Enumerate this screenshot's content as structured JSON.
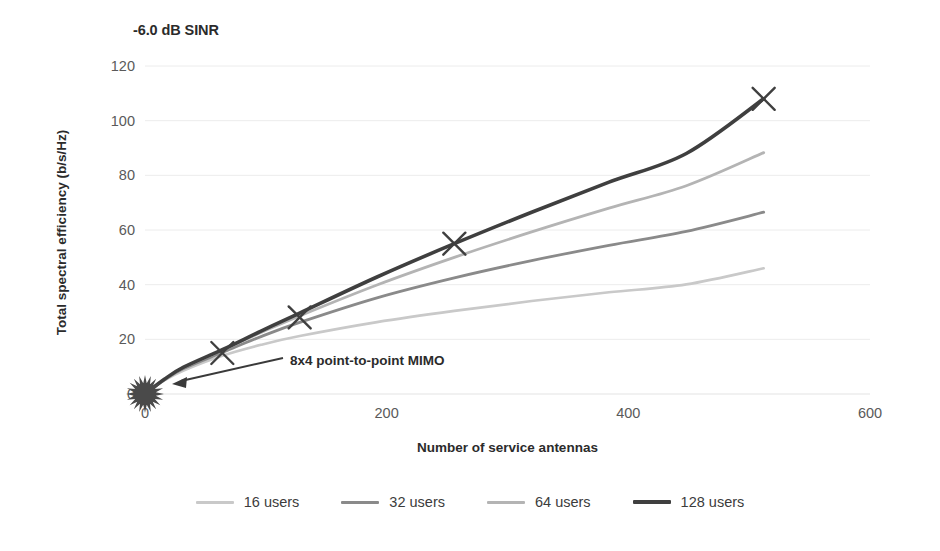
{
  "chart_data": {
    "type": "line",
    "title": "-6.0 dB SINR",
    "xlabel": "Number of service antennas",
    "ylabel": "Total spectral efficiency (b/s/Hz)",
    "xlim": [
      0,
      600
    ],
    "ylim": [
      0,
      120
    ],
    "xticks": [
      "0",
      "200",
      "400",
      "600"
    ],
    "xtick_values": [
      0,
      200,
      400,
      600
    ],
    "yticks": [
      "0",
      "20",
      "40",
      "60",
      "80",
      "100",
      "120"
    ],
    "ytick_values": [
      0,
      20,
      40,
      60,
      80,
      100,
      120
    ],
    "grid": "horizontal",
    "legend_position": "bottom",
    "series": [
      {
        "name": "16 users",
        "color": "#c9c9c9",
        "width": 2.6,
        "x": [
          0,
          16,
          32,
          64,
          96,
          128,
          192,
          256,
          320,
          384,
          448,
          512
        ],
        "values": [
          0,
          5.0,
          8.6,
          14.0,
          18.0,
          21.2,
          26.3,
          30.4,
          34.0,
          37.2,
          40.1,
          46.0
        ]
      },
      {
        "name": "32 users",
        "color": "#8a8a8a",
        "width": 2.8,
        "x": [
          0,
          16,
          32,
          64,
          96,
          128,
          192,
          256,
          320,
          384,
          448,
          512
        ],
        "values": [
          0,
          5.2,
          9.3,
          15.2,
          21.0,
          26.2,
          35.2,
          42.5,
          48.8,
          54.4,
          59.5,
          66.5
        ]
      },
      {
        "name": "64 users",
        "color": "#b4b4b4",
        "width": 2.8,
        "x": [
          0,
          16,
          32,
          64,
          96,
          128,
          192,
          256,
          320,
          384,
          448,
          512
        ],
        "values": [
          0,
          5.3,
          9.6,
          16.0,
          22.5,
          28.6,
          39.9,
          50.0,
          59.3,
          68.0,
          76.2,
          88.3
        ]
      },
      {
        "name": "128 users",
        "color": "#3f3f3f",
        "width": 3.6,
        "x": [
          0,
          16,
          32,
          64,
          96,
          128,
          192,
          256,
          320,
          384,
          448,
          512
        ],
        "values": [
          0,
          5.4,
          9.8,
          16.2,
          23.0,
          29.6,
          42.8,
          55.0,
          66.5,
          77.5,
          88.0,
          108.0
        ]
      }
    ],
    "markers": {
      "shape": "x",
      "color": "#3f3f3f",
      "points": [
        {
          "x": 64,
          "y": 15.0
        },
        {
          "x": 128,
          "y": 28.0
        },
        {
          "x": 256,
          "y": 55.0
        },
        {
          "x": 512,
          "y": 108.0
        }
      ]
    },
    "annotations": [
      {
        "text": "8x4 point-to-point MIMO",
        "target_x": 0,
        "target_y": 0,
        "marker": "starburst",
        "marker_color": "#4a4a4a"
      }
    ]
  },
  "legend": {
    "items": [
      {
        "label": "16 users",
        "color": "#c9c9c9"
      },
      {
        "label": "32 users",
        "color": "#8a8a8a"
      },
      {
        "label": "64 users",
        "color": "#b4b4b4"
      },
      {
        "label": "128 users",
        "color": "#3f3f3f"
      }
    ]
  },
  "style": {
    "background": "#ffffff",
    "grid_color": "#ececec",
    "axis_text_color": "#5a5a5a",
    "title_color": "#2b2b2b"
  }
}
